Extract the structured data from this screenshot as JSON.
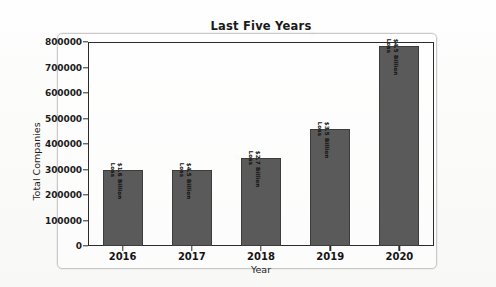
{
  "figure": {
    "frame_color": "#c9c9c9",
    "background": "#fdfdfd"
  },
  "chart_data": {
    "type": "bar",
    "title": "Last Five Years",
    "xlabel": "Year",
    "ylabel": "Total Companies",
    "categories": [
      "2016",
      "2017",
      "2018",
      "2019",
      "2020"
    ],
    "values": [
      300000,
      298000,
      345000,
      460000,
      785000
    ],
    "bar_labels": [
      "$1.6 Billion Loss",
      "$4.5 Billion Loss",
      "$2.7 Billion Loss",
      "$3.5 Billion Loss",
      "$4.5 Billion Loss"
    ],
    "ylim": [
      0,
      800000
    ],
    "yticks": [
      0,
      100000,
      200000,
      300000,
      400000,
      500000,
      600000,
      700000,
      800000
    ],
    "ytick_labels": [
      "0",
      "100000",
      "200000",
      "300000",
      "400000",
      "500000",
      "600000",
      "700000",
      "800000"
    ],
    "grid": false,
    "legend": null,
    "bar_color": "#5a5a5a",
    "bar_edge_color": "#3c3c3c",
    "axis_color": "#2b2b2b"
  }
}
